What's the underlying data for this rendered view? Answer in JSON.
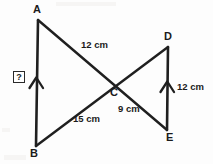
{
  "figure": {
    "background_color": "#fdfdfd",
    "stroke_color": "#1f1f1f",
    "width": 213,
    "height": 164
  },
  "vertices": [
    {
      "name": "A",
      "label": "A",
      "x": 38,
      "y": 20,
      "label_x": 33,
      "label_y": 4
    },
    {
      "name": "B",
      "label": "B",
      "x": 36,
      "y": 146,
      "label_x": 30,
      "label_y": 148
    },
    {
      "name": "C",
      "label": "C",
      "x": 113,
      "y": 82,
      "label_x": 110,
      "label_y": 87
    },
    {
      "name": "D",
      "label": "D",
      "x": 168,
      "y": 47,
      "label_x": 164,
      "label_y": 31
    },
    {
      "name": "E",
      "label": "E",
      "x": 167,
      "y": 130,
      "label_x": 166,
      "label_y": 132
    }
  ],
  "segments": [
    {
      "name": "AB",
      "from": "A",
      "to": "B",
      "x1": 38,
      "y1": 20,
      "x2": 36,
      "y2": 146,
      "tick": "single-arrow"
    },
    {
      "name": "AE",
      "from": "A",
      "to": "E",
      "x1": 38,
      "y1": 20,
      "x2": 167,
      "y2": 130,
      "tick": "none"
    },
    {
      "name": "BD",
      "from": "B",
      "to": "D",
      "x1": 36,
      "y1": 146,
      "x2": 168,
      "y2": 47,
      "tick": "none"
    },
    {
      "name": "DE",
      "from": "D",
      "to": "E",
      "x1": 168,
      "y1": 47,
      "x2": 167,
      "y2": 130,
      "tick": "single-arrow"
    }
  ],
  "measurements": [
    {
      "name": "AC",
      "text": "12 cm",
      "x": 81,
      "y": 40,
      "segment": "AC"
    },
    {
      "name": "BC",
      "text": "15 cm",
      "x": 73,
      "y": 114,
      "segment": "BC"
    },
    {
      "name": "CE",
      "text": "9 cm",
      "x": 118,
      "y": 104,
      "segment": "CE"
    },
    {
      "name": "DE",
      "text": "12 cm",
      "x": 177,
      "y": 82,
      "segment": "DE"
    }
  ],
  "unknown": {
    "label": "?",
    "x": 13,
    "y": 71,
    "refers_to": "AB"
  },
  "parallel_marks": [
    {
      "name": "AB-arrow",
      "x": 36,
      "y": 82,
      "direction": "up"
    },
    {
      "name": "DE-arrow",
      "x": 167,
      "y": 86,
      "direction": "up"
    }
  ]
}
